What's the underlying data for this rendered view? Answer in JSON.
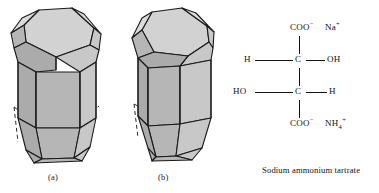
{
  "figure": {
    "panels": [
      {
        "id": "a",
        "label": "(a)",
        "caption_note": "left-handed crystal form"
      },
      {
        "id": "b",
        "label": "(b)",
        "caption_note": "right-handed crystal form"
      }
    ],
    "caption": "Sodium ammonium tartrate"
  },
  "structure": {
    "name": "Sodium ammonium tartrate",
    "rows": [
      {
        "id": "top",
        "left_group": "",
        "center": "COO",
        "center_charge": "−",
        "right_group": "Na",
        "right_charge": "+"
      },
      {
        "id": "c2",
        "left_group": "H",
        "center": "C",
        "center_charge": "",
        "right_group": "OH",
        "right_charge": ""
      },
      {
        "id": "c3",
        "left_group": "HO",
        "center": "C",
        "center_charge": "",
        "right_group": "H",
        "right_charge": ""
      },
      {
        "id": "bottom",
        "left_group": "",
        "center": "COO",
        "center_charge": "−",
        "right_group": "NH",
        "right_sub": "4",
        "right_charge": "+"
      }
    ],
    "labels": {
      "coo_top": "COO",
      "na": "Na",
      "h_left_c2": "H",
      "c_c2": "C",
      "oh_right_c2": "OH",
      "ho_left_c3": "HO",
      "c_c3": "C",
      "h_right_c3": "H",
      "coo_bottom": "COO",
      "nh4": "NH",
      "nh4_sub": "4",
      "minus": "−",
      "plus": "+"
    }
  },
  "colors": {
    "face_light": "#dcdcdc",
    "face_mid": "#c6c6c6",
    "face_dark": "#b4b4b4",
    "face_darker": "#a8a8a8",
    "outline": "#1a1a1a",
    "hidden_edge": "#333333",
    "text": "#111111",
    "background": "#ffffff"
  },
  "crystal_a": {
    "name": "crystal-hemihedral-left",
    "viewbox": "0 0 105 170"
  },
  "crystal_b": {
    "name": "crystal-hemihedral-right",
    "viewbox": "0 0 110 170"
  }
}
